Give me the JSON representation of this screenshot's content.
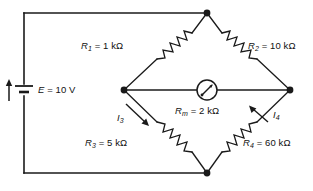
{
  "diagram": {
    "stroke_color": "#1a1a1a",
    "background_color": "#ffffff",
    "source": {
      "name": "voltage-source",
      "symbol": "battery",
      "label_text": "E = 10 V",
      "label_var": "E",
      "label_value": "= 10 V",
      "current_arrow": "up"
    },
    "resistors": [
      {
        "id": "R1",
        "name": "resistor-r1",
        "var": "R",
        "sub": "1",
        "value_text": "= 1 kΩ",
        "full_text": "R1 = 1 kΩ",
        "branch": "top-left"
      },
      {
        "id": "R2",
        "name": "resistor-r2",
        "var": "R",
        "sub": "2",
        "value_text": "= 10 kΩ",
        "full_text": "R2 = 10 kΩ",
        "branch": "top-right"
      },
      {
        "id": "R3",
        "name": "resistor-r3",
        "var": "R",
        "sub": "3",
        "value_text": "= 5 kΩ",
        "full_text": "R3 = 5 kΩ",
        "branch": "bottom-left"
      },
      {
        "id": "R4",
        "name": "resistor-r4",
        "var": "R",
        "sub": "4",
        "value_text": "= 60 kΩ",
        "full_text": "R4 = 60 kΩ",
        "branch": "bottom-right"
      }
    ],
    "meter": {
      "name": "galvanometer",
      "symbol": "meter-circle-with-needle",
      "var": "R",
      "sub": "m",
      "value_text": "= 2 kΩ",
      "full_text": "Rm = 2 kΩ"
    },
    "currents": [
      {
        "id": "I3",
        "name": "current-i3",
        "var": "I",
        "sub": "3",
        "arrow_direction": "down-right"
      },
      {
        "id": "I4",
        "name": "current-i4",
        "var": "I",
        "sub": "4",
        "arrow_direction": "up-left"
      }
    ],
    "nodes": [
      {
        "name": "node-top",
        "x": 207,
        "y": 13
      },
      {
        "name": "node-left",
        "x": 124,
        "y": 90
      },
      {
        "name": "node-right",
        "x": 290,
        "y": 90
      },
      {
        "name": "node-bottom",
        "x": 207,
        "y": 173
      }
    ]
  }
}
